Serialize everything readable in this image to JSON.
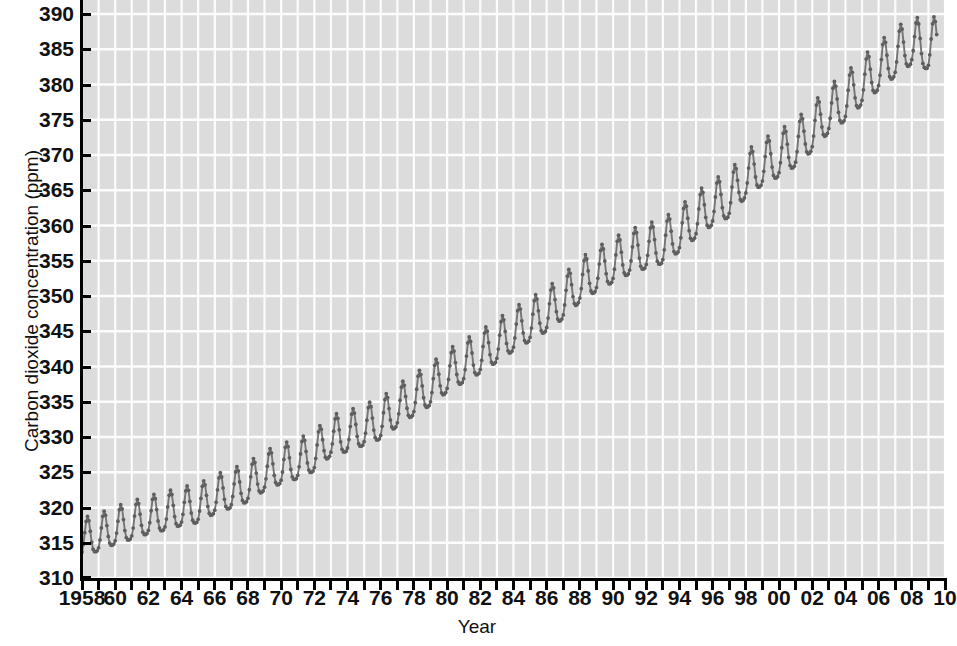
{
  "chart_data": {
    "type": "line",
    "title": "",
    "xlabel": "Year",
    "ylabel": "Carbon dioxide concentration (ppm)",
    "xlim": [
      1958,
      2010
    ],
    "ylim": [
      310,
      390
    ],
    "grid": true,
    "legend": "none",
    "series_name": "Atmospheric CO2 (Mauna Loa monthly mean)",
    "line_color": "#757575",
    "marker": "circle",
    "marker_color": "#5e5e5e",
    "plot_background": "#dcdcdc",
    "gridline_color": "#ffffff",
    "axis_color": "#000000",
    "y_ticks": [
      310,
      315,
      320,
      325,
      330,
      335,
      340,
      345,
      350,
      355,
      360,
      365,
      370,
      375,
      380,
      385,
      390
    ],
    "y_tick_labels": [
      "310",
      "315",
      "320",
      "325",
      "330",
      "335",
      "340",
      "345",
      "350",
      "355",
      "360",
      "365",
      "370",
      "375",
      "380",
      "385",
      "390"
    ],
    "x_ticks": [
      1958,
      1959,
      1960,
      1961,
      1962,
      1963,
      1964,
      1965,
      1966,
      1967,
      1968,
      1969,
      1970,
      1971,
      1972,
      1973,
      1974,
      1975,
      1976,
      1977,
      1978,
      1979,
      1980,
      1981,
      1982,
      1983,
      1984,
      1985,
      1986,
      1987,
      1988,
      1989,
      1990,
      1991,
      1992,
      1993,
      1994,
      1995,
      1996,
      1997,
      1998,
      1999,
      2000,
      2001,
      2002,
      2003,
      2004,
      2005,
      2006,
      2007,
      2008,
      2009,
      2010
    ],
    "x_tick_labels": [
      {
        "year": 1958,
        "label": "1958"
      },
      {
        "year": 1960,
        "label": "60"
      },
      {
        "year": 1962,
        "label": "62"
      },
      {
        "year": 1964,
        "label": "64"
      },
      {
        "year": 1966,
        "label": "66"
      },
      {
        "year": 1968,
        "label": "68"
      },
      {
        "year": 1970,
        "label": "70"
      },
      {
        "year": 1972,
        "label": "72"
      },
      {
        "year": 1974,
        "label": "74"
      },
      {
        "year": 1976,
        "label": "76"
      },
      {
        "year": 1978,
        "label": "78"
      },
      {
        "year": 1980,
        "label": "80"
      },
      {
        "year": 1982,
        "label": "82"
      },
      {
        "year": 1984,
        "label": "84"
      },
      {
        "year": 1986,
        "label": "86"
      },
      {
        "year": 1988,
        "label": "88"
      },
      {
        "year": 1990,
        "label": "90"
      },
      {
        "year": 1992,
        "label": "92"
      },
      {
        "year": 1994,
        "label": "94"
      },
      {
        "year": 1996,
        "label": "96"
      },
      {
        "year": 1998,
        "label": "98"
      },
      {
        "year": 2000,
        "label": "00"
      },
      {
        "year": 2002,
        "label": "02"
      },
      {
        "year": 2004,
        "label": "04"
      },
      {
        "year": 2006,
        "label": "06"
      },
      {
        "year": 2008,
        "label": "08"
      },
      {
        "year": 2010,
        "label": "10"
      }
    ],
    "annual_mean": [
      {
        "year": 1958,
        "value": 315.3
      },
      {
        "year": 1959,
        "value": 315.9
      },
      {
        "year": 1960,
        "value": 316.9
      },
      {
        "year": 1961,
        "value": 317.6
      },
      {
        "year": 1962,
        "value": 318.4
      },
      {
        "year": 1963,
        "value": 318.9
      },
      {
        "year": 1964,
        "value": 319.6
      },
      {
        "year": 1965,
        "value": 320.0
      },
      {
        "year": 1966,
        "value": 321.3
      },
      {
        "year": 1967,
        "value": 322.1
      },
      {
        "year": 1968,
        "value": 323.0
      },
      {
        "year": 1969,
        "value": 324.6
      },
      {
        "year": 1970,
        "value": 325.6
      },
      {
        "year": 1971,
        "value": 326.3
      },
      {
        "year": 1972,
        "value": 327.4
      },
      {
        "year": 1973,
        "value": 329.6
      },
      {
        "year": 1974,
        "value": 330.2
      },
      {
        "year": 1975,
        "value": 331.1
      },
      {
        "year": 1976,
        "value": 332.0
      },
      {
        "year": 1977,
        "value": 333.8
      },
      {
        "year": 1978,
        "value": 335.4
      },
      {
        "year": 1979,
        "value": 336.8
      },
      {
        "year": 1980,
        "value": 338.7
      },
      {
        "year": 1981,
        "value": 340.1
      },
      {
        "year": 1982,
        "value": 341.4
      },
      {
        "year": 1983,
        "value": 343.0
      },
      {
        "year": 1984,
        "value": 344.6
      },
      {
        "year": 1985,
        "value": 346.0
      },
      {
        "year": 1986,
        "value": 347.4
      },
      {
        "year": 1987,
        "value": 349.2
      },
      {
        "year": 1988,
        "value": 351.6
      },
      {
        "year": 1989,
        "value": 353.1
      },
      {
        "year": 1990,
        "value": 354.4
      },
      {
        "year": 1991,
        "value": 355.6
      },
      {
        "year": 1992,
        "value": 356.4
      },
      {
        "year": 1993,
        "value": 357.1
      },
      {
        "year": 1994,
        "value": 358.8
      },
      {
        "year": 1995,
        "value": 360.8
      },
      {
        "year": 1996,
        "value": 362.6
      },
      {
        "year": 1997,
        "value": 363.7
      },
      {
        "year": 1998,
        "value": 366.6
      },
      {
        "year": 1999,
        "value": 368.3
      },
      {
        "year": 2000,
        "value": 369.5
      },
      {
        "year": 2001,
        "value": 371.0
      },
      {
        "year": 2002,
        "value": 373.2
      },
      {
        "year": 2003,
        "value": 375.8
      },
      {
        "year": 2004,
        "value": 377.5
      },
      {
        "year": 2005,
        "value": 379.8
      },
      {
        "year": 2006,
        "value": 381.9
      },
      {
        "year": 2007,
        "value": 383.8
      },
      {
        "year": 2008,
        "value": 385.6
      },
      {
        "year": 2009,
        "value": 384.8
      }
    ],
    "seasonal_amplitude_ppm": 6.0,
    "seasonal_peak_month": 5,
    "seasonal_trough_month": 10,
    "data_start": "1958",
    "data_end": "mid-2009",
    "sampling": "monthly"
  }
}
